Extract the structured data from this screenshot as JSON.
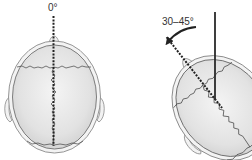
{
  "diagram": {
    "panels": [
      {
        "id": "neutral",
        "angle_label": "0°",
        "description": "Top view of skull, head in neutral position with vertical dashed midline"
      },
      {
        "id": "rotated",
        "angle_label": "30–45°",
        "description": "Top view of skull rotated, dashed line at 30–45° from vertical solid reference line, curved arrow indicating rotation"
      }
    ],
    "colors": {
      "skull_fill": "#e6e6e6",
      "skull_outline": "#7a7a7a",
      "suture": "#444444",
      "line": "#222222",
      "text": "#333333"
    }
  }
}
